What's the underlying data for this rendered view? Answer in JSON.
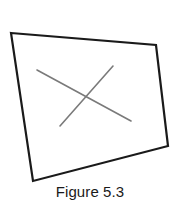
{
  "figure": {
    "caption": "Figure 5.3",
    "background_color": "#ffffff",
    "outline_color": "#1a1a1a",
    "outline_width": 2.2,
    "cross_color": "#7a7a7a",
    "cross_width": 1.6,
    "caption_color": "#1a1a1a",
    "quadrilateral": {
      "name": "tilted-rectangle-outline",
      "points": "11,33 156,45 168,146 33,181",
      "corners": [
        {
          "label": "top-left",
          "x": 11,
          "y": 33
        },
        {
          "label": "top-right",
          "x": 156,
          "y": 45
        },
        {
          "label": "bottom-right",
          "x": 168,
          "y": 146
        },
        {
          "label": "bottom-left",
          "x": 33,
          "y": 181
        }
      ]
    },
    "cross": {
      "name": "x-mark",
      "strokes": [
        {
          "label": "descending-stroke",
          "x1": 37,
          "y1": 70,
          "x2": 131,
          "y2": 121
        },
        {
          "label": "ascending-stroke",
          "x1": 60,
          "y1": 126,
          "x2": 113,
          "y2": 66
        }
      ],
      "intersection": {
        "x": 87,
        "y": 96
      }
    }
  }
}
